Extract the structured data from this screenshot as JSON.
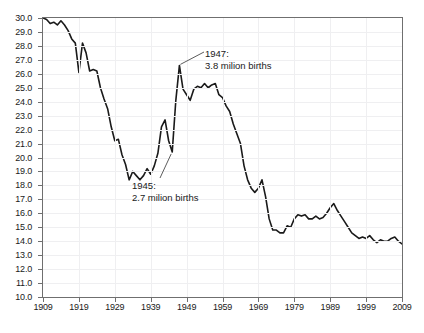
{
  "chart_data": {
    "type": "line",
    "title": "",
    "subtitle": "",
    "xlabel": "",
    "ylabel": "",
    "xlim": [
      1909,
      2009
    ],
    "ylim": [
      10.0,
      30.0
    ],
    "grid": true,
    "legend": "none",
    "x_tick_labels": [
      "1909",
      "1919",
      "1929",
      "1939",
      "1949",
      "1959",
      "1969",
      "1979",
      "1989",
      "1999",
      "2009"
    ],
    "x_tick_values": [
      1909,
      1919,
      1929,
      1939,
      1949,
      1959,
      1969,
      1979,
      1989,
      1999,
      2009
    ],
    "y_tick_labels": [
      "30.0",
      "29.0",
      "28.0",
      "27.0",
      "26.0",
      "25.0",
      "24.0",
      "23.0",
      "22.0",
      "21.0",
      "20.0",
      "19.0",
      "18.0",
      "17.0",
      "16.0",
      "15.0",
      "14.0",
      "13.0",
      "12.0",
      "11.0",
      "10.0"
    ],
    "y_tick_values": [
      30,
      29,
      28,
      27,
      26,
      25,
      24,
      23,
      22,
      21,
      20,
      19,
      18,
      17,
      16,
      15,
      14,
      13,
      12,
      11,
      10
    ],
    "line_color": "#1a1a1a",
    "series": [
      {
        "name": "birth rate",
        "x": [
          1909,
          1910,
          1911,
          1912,
          1913,
          1914,
          1915,
          1916,
          1917,
          1918,
          1919,
          1920,
          1921,
          1922,
          1923,
          1924,
          1925,
          1926,
          1927,
          1928,
          1929,
          1930,
          1931,
          1932,
          1933,
          1934,
          1935,
          1936,
          1937,
          1938,
          1939,
          1940,
          1941,
          1942,
          1943,
          1944,
          1945,
          1946,
          1947,
          1948,
          1949,
          1950,
          1951,
          1952,
          1953,
          1954,
          1955,
          1956,
          1957,
          1958,
          1959,
          1960,
          1961,
          1962,
          1963,
          1964,
          1965,
          1966,
          1967,
          1968,
          1969,
          1970,
          1971,
          1972,
          1973,
          1974,
          1975,
          1976,
          1977,
          1978,
          1979,
          1980,
          1981,
          1982,
          1983,
          1984,
          1985,
          1986,
          1987,
          1988,
          1989,
          1990,
          1991,
          1992,
          1993,
          1994,
          1995,
          1996,
          1997,
          1998,
          1999,
          2000,
          2001,
          2002,
          2003,
          2004,
          2005,
          2006,
          2007,
          2008,
          2009
        ],
        "values": [
          30.0,
          29.9,
          29.6,
          29.7,
          29.5,
          29.8,
          29.5,
          29.1,
          28.5,
          28.2,
          26.1,
          28.2,
          27.5,
          26.2,
          26.3,
          26.2,
          25.0,
          24.2,
          23.5,
          22.2,
          21.2,
          21.3,
          20.2,
          19.5,
          18.4,
          19.0,
          18.7,
          18.4,
          18.7,
          19.2,
          18.8,
          19.4,
          20.3,
          22.2,
          22.7,
          21.2,
          20.4,
          24.1,
          26.6,
          24.9,
          24.5,
          24.1,
          24.9,
          25.1,
          25.0,
          25.3,
          25.0,
          25.2,
          25.3,
          24.5,
          24.3,
          23.7,
          23.3,
          22.4,
          21.7,
          21.0,
          19.4,
          18.4,
          17.8,
          17.5,
          17.8,
          18.4,
          17.2,
          15.6,
          14.8,
          14.8,
          14.6,
          14.6,
          15.1,
          15.0,
          15.6,
          15.9,
          15.8,
          15.9,
          15.6,
          15.6,
          15.8,
          15.6,
          15.7,
          16.0,
          16.4,
          16.7,
          16.2,
          15.8,
          15.4,
          15.0,
          14.6,
          14.4,
          14.2,
          14.3,
          14.2,
          14.4,
          14.1,
          13.9,
          14.1,
          14.0,
          14.0,
          14.2,
          14.3,
          14.0,
          13.8
        ]
      }
    ],
    "annotations": [
      {
        "id": "1947",
        "line1": "1947:",
        "line2": "3.8 milion births",
        "point_x": 1947,
        "point_y": 26.6
      },
      {
        "id": "1945",
        "line1": "1945:",
        "line2": "2.7 milion births",
        "point_x": 1945,
        "point_y": 20.4
      }
    ]
  }
}
